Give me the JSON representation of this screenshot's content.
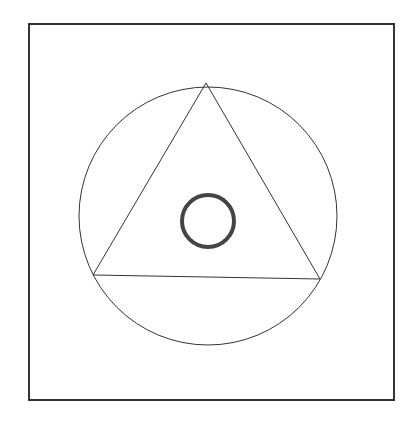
{
  "diagram": {
    "background": "#ffffff",
    "stroke_color": "#333333",
    "ring_color": "#444444",
    "frame": {
      "x": 29,
      "y": 24,
      "width": 365,
      "height": 376,
      "stroke_width": 2
    },
    "outer_circle": {
      "cx": 208,
      "cy": 216,
      "r": 129,
      "stroke_width": 1
    },
    "triangle": {
      "points": "206,83 93,275 320,279",
      "stroke_width": 1
    },
    "inner_ring": {
      "cx": 208,
      "cy": 221,
      "r": 26,
      "stroke_width": 4
    }
  }
}
